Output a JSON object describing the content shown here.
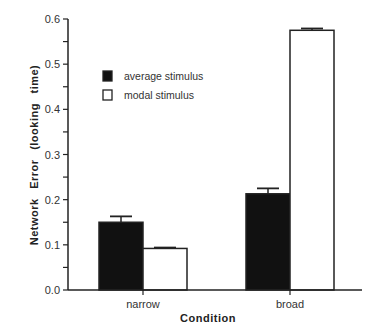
{
  "chart_data": {
    "type": "bar",
    "title": "",
    "xlabel": "Condition",
    "ylabel": "Network Error (looking time)",
    "categories": [
      "narrow",
      "broad"
    ],
    "series": [
      {
        "name": "average stimulus",
        "color": "#111111",
        "values": [
          0.15,
          0.213
        ],
        "errors": [
          0.013,
          0.012
        ]
      },
      {
        "name": "modal stimulus",
        "color": "#ffffff",
        "values": [
          0.092,
          0.575
        ],
        "errors": [
          0.002,
          0.004
        ]
      }
    ],
    "ylim": [
      0,
      0.6
    ],
    "yticks": [
      "0.0",
      "0.1",
      "0.2",
      "0.3",
      "0.4",
      "0.5",
      "0.6"
    ],
    "grid": false,
    "legend_position": "upper-left inside"
  }
}
